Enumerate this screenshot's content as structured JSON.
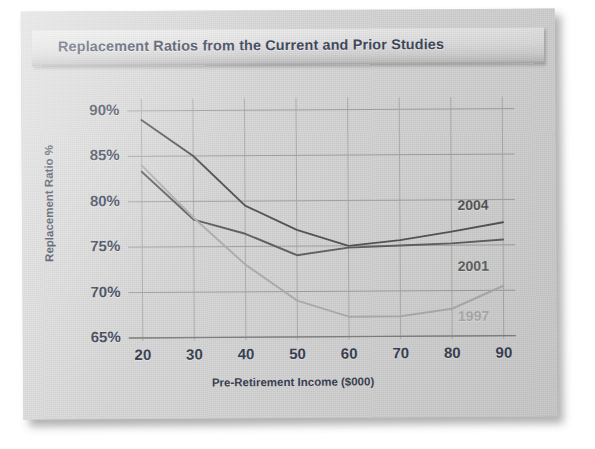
{
  "title": "Replacement Ratios from the Current and Prior Studies",
  "chart_data": {
    "type": "line",
    "title": "Replacement Ratios from the Current and Prior Studies",
    "xlabel": "Pre-Retirement Income ($000)",
    "ylabel": "Replacement Ratio %",
    "x": [
      20,
      30,
      40,
      50,
      60,
      70,
      80,
      90
    ],
    "xticklabels": [
      "20",
      "30",
      "40",
      "50",
      "60",
      "70",
      "80",
      "90"
    ],
    "yticklabels": [
      "65%",
      "70%",
      "75%",
      "80%",
      "85%",
      "90%"
    ],
    "yticks": [
      65,
      70,
      75,
      80,
      85,
      90
    ],
    "xlim": [
      20,
      90
    ],
    "ylim": [
      64,
      91
    ],
    "grid": true,
    "legend_position": "inline-right",
    "series": [
      {
        "name": "2004",
        "label": "2004",
        "color": "#3c3c3c",
        "values": [
          89,
          85,
          79.5,
          76.8,
          75.0,
          75.6,
          76.5,
          77.5
        ]
      },
      {
        "name": "2001",
        "label": "2001",
        "color": "#4a4a4a",
        "values": [
          83.3,
          78.0,
          76.4,
          74.0,
          74.8,
          75.0,
          75.2,
          75.6
        ]
      },
      {
        "name": "1997",
        "label": "1997",
        "color": "#a6a6a6",
        "values": [
          84.0,
          78.2,
          73.0,
          69.0,
          67.2,
          67.2,
          68.0,
          70.5
        ]
      }
    ]
  }
}
